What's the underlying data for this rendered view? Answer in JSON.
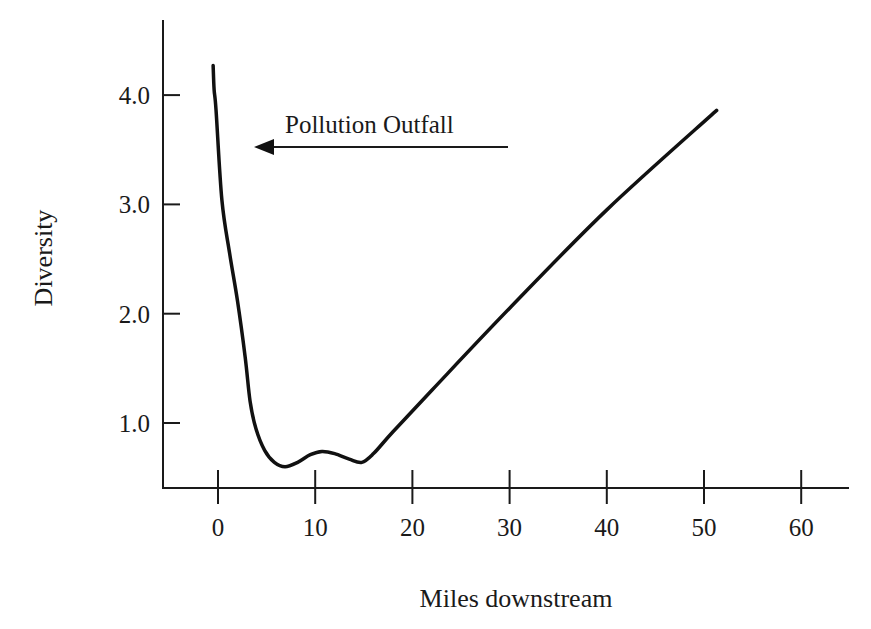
{
  "chart_data": {
    "type": "line",
    "title": "",
    "xlabel": "Miles downstream",
    "ylabel": "Diversity",
    "xlim": [
      -6,
      65
    ],
    "ylim": [
      0.4,
      4.6
    ],
    "x_ticks": [
      0,
      10,
      20,
      30,
      40,
      50,
      60
    ],
    "x_tick_labels": [
      "0",
      "10",
      "20",
      "30",
      "40",
      "50",
      "60"
    ],
    "y_ticks": [
      1.0,
      2.0,
      3.0,
      4.0
    ],
    "y_tick_labels": [
      "1.0",
      "2.0",
      "3.0",
      "4.0"
    ],
    "grid": false,
    "legend": "none",
    "series": [
      {
        "name": "Diversity",
        "x": [
          -0.5,
          -0.4,
          -0.2,
          0.4,
          1.2,
          2.0,
          2.8,
          3.3,
          3.9,
          4.8,
          5.8,
          6.9,
          8.2,
          9.5,
          10.7,
          12.0,
          13.5,
          14.8,
          16.0,
          18.0,
          22.0,
          30.0,
          40.0,
          51.3
        ],
        "y": [
          4.27,
          4.05,
          3.86,
          3.04,
          2.55,
          2.12,
          1.6,
          1.2,
          0.95,
          0.75,
          0.64,
          0.6,
          0.64,
          0.71,
          0.74,
          0.72,
          0.67,
          0.64,
          0.72,
          0.92,
          1.3,
          2.05,
          2.95,
          3.86
        ]
      }
    ],
    "annotations": [
      {
        "text": "Pollution Outfall",
        "type": "arrow-label",
        "arrow_direction": "left",
        "points_to_x": 3.7,
        "at_y": 3.52
      }
    ]
  }
}
